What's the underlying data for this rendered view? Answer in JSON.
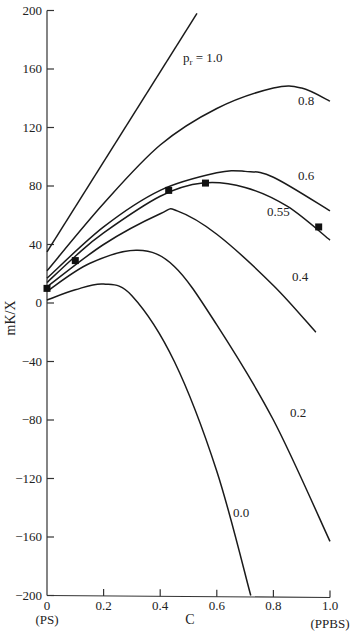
{
  "chart_data": {
    "type": "line",
    "title": "",
    "xlabel": "C",
    "ylabel": "mK/X",
    "xlim": [
      0,
      1.0
    ],
    "ylim": [
      -200,
      200
    ],
    "x_ticks": [
      "0",
      "0.2",
      "0.4",
      "0.6",
      "0.8",
      "1.0"
    ],
    "x_tick_values": [
      0,
      0.2,
      0.4,
      0.6,
      0.8,
      1.0
    ],
    "x_end_labels": {
      "left": "(PS)",
      "right": "(PPBS)"
    },
    "y_ticks": [
      "200",
      "160",
      "120",
      "80",
      "40",
      "0",
      "-40",
      "-80",
      "-120",
      "-160",
      "-200"
    ],
    "y_tick_values": [
      200,
      160,
      120,
      80,
      40,
      0,
      -40,
      -80,
      -120,
      -160,
      -200
    ],
    "grid": false,
    "legend": "inline curve labels",
    "series": [
      {
        "name": "p_r = 1.0",
        "label": "1.0",
        "x": [
          0,
          0.53
        ],
        "y": [
          35,
          198
        ]
      },
      {
        "name": "0.8",
        "label": "0.8",
        "x": [
          0,
          0.2,
          0.4,
          0.6,
          0.8,
          0.9,
          1.0
        ],
        "y": [
          22,
          68,
          108,
          133,
          147,
          147,
          138
        ]
      },
      {
        "name": "0.6",
        "label": "0.6",
        "x": [
          0,
          0.2,
          0.4,
          0.6,
          0.7,
          0.8,
          1.0
        ],
        "y": [
          17,
          52,
          77,
          89,
          90,
          86,
          63
        ]
      },
      {
        "name": "0.55",
        "label": "0.55",
        "x": [
          0,
          0.1,
          0.2,
          0.4,
          0.55,
          0.7,
          0.85,
          1.0
        ],
        "y": [
          14,
          32,
          48,
          73,
          82,
          79,
          66,
          43
        ]
      },
      {
        "name": "0.4",
        "label": "0.4",
        "x": [
          0,
          0.2,
          0.4,
          0.46,
          0.6,
          0.8,
          0.95
        ],
        "y": [
          11,
          40,
          61,
          63,
          47,
          12,
          -20
        ]
      },
      {
        "name": "0.2",
        "label": "0.2",
        "x": [
          0,
          0.15,
          0.32,
          0.45,
          0.6,
          0.8,
          1.0
        ],
        "y": [
          8,
          27,
          36,
          25,
          -15,
          -80,
          -163
        ]
      },
      {
        "name": "0.0",
        "label": "0.0",
        "x": [
          0,
          0.1,
          0.2,
          0.3,
          0.45,
          0.6,
          0.72
        ],
        "y": [
          2,
          9,
          13,
          5,
          -40,
          -115,
          -200
        ]
      }
    ],
    "markers": {
      "shape": "square",
      "x": [
        0,
        0.1,
        0.43,
        0.56,
        0.96
      ],
      "y": [
        10,
        29,
        77,
        82,
        52
      ]
    }
  },
  "labels": {
    "pr_prefix": "p",
    "pr_sub": "r",
    "pr_value": " = 1.0",
    "l08": "0.8",
    "l06": "0.6",
    "l055": "0.55",
    "l04": "0.4",
    "l02": "0.2",
    "l00": "0.0"
  }
}
